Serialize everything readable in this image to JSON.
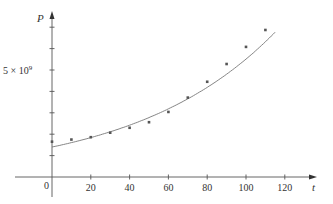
{
  "chart_data": {
    "type": "scatter",
    "title": "",
    "xlabel": "t",
    "ylabel": "P",
    "x_ticks": [
      0,
      20,
      40,
      60,
      80,
      100,
      120
    ],
    "x_tick_labels": [
      "0",
      "20",
      "40",
      "60",
      "80",
      "100",
      "120"
    ],
    "y_tick_values": [
      1000000000.0,
      2000000000.0,
      3000000000.0,
      4000000000.0,
      5000000000.0,
      6000000000.0,
      7000000000.0
    ],
    "y_labeled_tick": {
      "value": 5000000000.0,
      "label": "5 × 10⁹"
    },
    "xlim": [
      -19,
      135
    ],
    "ylim": [
      0,
      7300000000.0
    ],
    "grid": false,
    "legend": null,
    "series": [
      {
        "name": "data",
        "kind": "scatter",
        "x": [
          0,
          10,
          20,
          30,
          40,
          50,
          60,
          70,
          80,
          90,
          100,
          110
        ],
        "y": [
          1650000000.0,
          1750000000.0,
          1860000000.0,
          2070000000.0,
          2300000000.0,
          2560000000.0,
          3040000000.0,
          3710000000.0,
          4450000000.0,
          5280000000.0,
          6080000000.0,
          6870000000.0
        ]
      },
      {
        "name": "exponential model",
        "kind": "line",
        "model": "P = 1.4 × 10⁹ · e^(0.0137 t)",
        "a": 1400000000.0,
        "k": 0.0137,
        "t_range": [
          0,
          115
        ]
      }
    ]
  },
  "labels": {
    "y_axis": "P",
    "x_axis": "t",
    "y_tick_5": "5 × 10",
    "y_tick_5_exp": "9",
    "origin": "0"
  }
}
